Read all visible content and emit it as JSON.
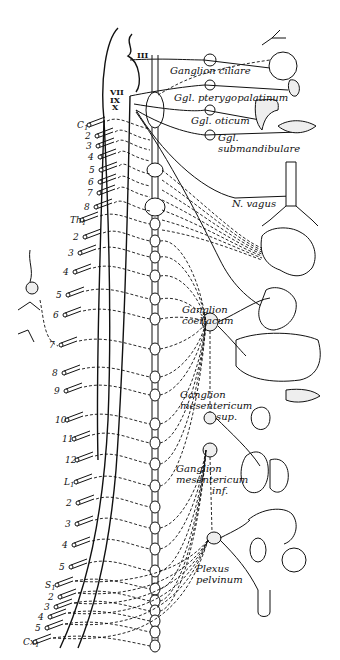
{
  "figure": {
    "cranial_nerves": [
      {
        "label": "III",
        "x": 137,
        "y": 58
      },
      {
        "label": "VII",
        "x": 110,
        "y": 95
      },
      {
        "label": "IX",
        "x": 110,
        "y": 103
      },
      {
        "label": "X",
        "x": 112,
        "y": 110
      }
    ],
    "ganglia_labels": [
      {
        "id": "ciliare",
        "lines": [
          "Ganglion ciliare"
        ],
        "x": 170,
        "y": 74
      },
      {
        "id": "pterygopalatinum",
        "lines": [
          "Ggl. pterygopalatinum"
        ],
        "x": 174,
        "y": 101
      },
      {
        "id": "oticum",
        "lines": [
          "Ggl. oticum"
        ],
        "x": 191,
        "y": 124
      },
      {
        "id": "submandibulare",
        "lines": [
          "Ggl.",
          "submandibulare"
        ],
        "x": 218,
        "y": 141
      },
      {
        "id": "vagus",
        "lines": [
          "N. vagus"
        ],
        "x": 232,
        "y": 207
      },
      {
        "id": "coeliacum",
        "lines": [
          "Ganglion",
          "coeliacum"
        ],
        "x": 182,
        "y": 313
      },
      {
        "id": "mesentericum-sup",
        "lines": [
          "Ganglion",
          "mesentericum",
          "sup."
        ],
        "x": 180,
        "y": 398
      },
      {
        "id": "mesentericum-inf",
        "lines": [
          "Ganglion",
          "mesentericum",
          "inf."
        ],
        "x": 176,
        "y": 472
      },
      {
        "id": "plexus-pelvinum",
        "lines": [
          "Plexus",
          "pelvinum"
        ],
        "x": 196,
        "y": 572
      }
    ],
    "spinal_segments": [
      {
        "label": "C1",
        "x": 77,
        "y": 128
      },
      {
        "label": "2",
        "x": 85,
        "y": 139
      },
      {
        "label": "3",
        "x": 86,
        "y": 149
      },
      {
        "label": "4",
        "x": 88,
        "y": 160
      },
      {
        "label": "5",
        "x": 89,
        "y": 173
      },
      {
        "label": "6",
        "x": 88,
        "y": 185
      },
      {
        "label": "7",
        "x": 87,
        "y": 196
      },
      {
        "label": "8",
        "x": 84,
        "y": 210
      },
      {
        "label": "Th1",
        "x": 70,
        "y": 223
      },
      {
        "label": "2",
        "x": 73,
        "y": 240
      },
      {
        "label": "3",
        "x": 68,
        "y": 256
      },
      {
        "label": "4",
        "x": 63,
        "y": 275
      },
      {
        "label": "5",
        "x": 56,
        "y": 298
      },
      {
        "label": "6",
        "x": 53,
        "y": 318
      },
      {
        "label": "7",
        "x": 49,
        "y": 348
      },
      {
        "label": "8",
        "x": 52,
        "y": 376
      },
      {
        "label": "9",
        "x": 54,
        "y": 394
      },
      {
        "label": "10",
        "x": 55,
        "y": 423
      },
      {
        "label": "11",
        "x": 62,
        "y": 442
      },
      {
        "label": "12",
        "x": 65,
        "y": 463
      },
      {
        "label": "L1",
        "x": 64,
        "y": 485
      },
      {
        "label": "2",
        "x": 66,
        "y": 506
      },
      {
        "label": "3",
        "x": 65,
        "y": 527
      },
      {
        "label": "4",
        "x": 62,
        "y": 548
      },
      {
        "label": "5",
        "x": 59,
        "y": 570
      },
      {
        "label": "S1",
        "x": 45,
        "y": 588
      },
      {
        "label": "2",
        "x": 48,
        "y": 600
      },
      {
        "label": "3",
        "x": 44,
        "y": 610
      },
      {
        "label": "4",
        "x": 38,
        "y": 620
      },
      {
        "label": "5",
        "x": 35,
        "y": 631
      },
      {
        "label": "Cx1",
        "x": 23,
        "y": 645
      }
    ]
  }
}
